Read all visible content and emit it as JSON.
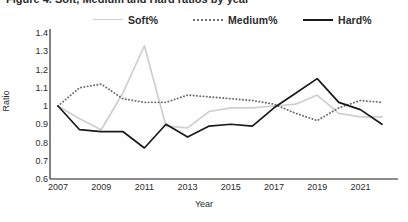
{
  "title": {
    "text": "Figure 4. Soft, Medium and Hard ratios by year",
    "clipped": true
  },
  "axis_titles": {
    "y": "Ratio",
    "x": "Year"
  },
  "legend": {
    "position": "top",
    "items": [
      {
        "label": "Soft%",
        "color": "#cfcfcf",
        "style": "solid",
        "name": "soft"
      },
      {
        "label": "Medium%",
        "color": "#6e6e6e",
        "style": "dotted",
        "name": "medium"
      },
      {
        "label": "Hard%",
        "color": "#1a1a1a",
        "style": "solid",
        "name": "hard"
      }
    ]
  },
  "chart_data": {
    "type": "line",
    "title": "Figure 4. Soft, Medium and Hard ratios by year",
    "xlabel": "Year",
    "ylabel": "Ratio",
    "xlim": [
      2007,
      2022
    ],
    "ylim": [
      0.6,
      1.4
    ],
    "ytick_values": [
      1.4,
      1.3,
      1.2,
      1.1,
      1.0,
      0.9,
      0.8,
      0.7,
      0.6
    ],
    "ytick_labels": [
      "1.4",
      "1.3",
      "1.2",
      "1.1",
      "1",
      "0.9",
      "0.8",
      "0.7",
      "0.6"
    ],
    "xtick_values": [
      2007,
      2009,
      2011,
      2013,
      2015,
      2017,
      2019,
      2021
    ],
    "xtick_labels": [
      "2007",
      "2009",
      "2011",
      "2013",
      "2015",
      "2017",
      "2019",
      "2021"
    ],
    "x": [
      2007,
      2008,
      2009,
      2010,
      2011,
      2012,
      2013,
      2014,
      2015,
      2016,
      2017,
      2018,
      2019,
      2020,
      2021,
      2022
    ],
    "grid": false,
    "legend_position": "top",
    "series": [
      {
        "name": "Soft%",
        "color": "#cfcfcf",
        "style": "solid",
        "values": [
          1.0,
          0.93,
          0.87,
          1.07,
          1.33,
          0.89,
          0.88,
          0.97,
          0.99,
          0.99,
          1.0,
          1.01,
          1.06,
          0.96,
          0.94,
          0.94
        ]
      },
      {
        "name": "Medium%",
        "color": "#6e6e6e",
        "style": "dotted",
        "values": [
          1.0,
          1.1,
          1.12,
          1.04,
          1.02,
          1.02,
          1.06,
          1.05,
          1.04,
          1.03,
          1.01,
          0.96,
          0.92,
          0.99,
          1.03,
          1.02
        ]
      },
      {
        "name": "Hard%",
        "color": "#1a1a1a",
        "style": "solid",
        "values": [
          1.0,
          0.87,
          0.86,
          0.86,
          0.77,
          0.9,
          0.83,
          0.89,
          0.9,
          0.89,
          0.99,
          1.07,
          1.15,
          1.02,
          0.98,
          0.9
        ]
      }
    ]
  }
}
